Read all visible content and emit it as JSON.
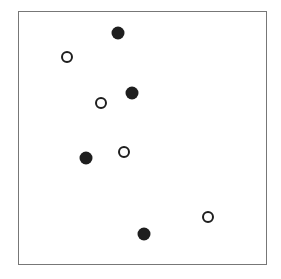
{
  "diagram": {
    "frame": {
      "left": 18,
      "top": 11,
      "right": 267,
      "bottom": 265,
      "border_color": "#777777"
    },
    "marker_color": "#1e1e1e",
    "points": [
      {
        "type": "filled",
        "x": 118,
        "y": 33
      },
      {
        "type": "open",
        "x": 67,
        "y": 57
      },
      {
        "type": "filled",
        "x": 132,
        "y": 93
      },
      {
        "type": "open",
        "x": 101,
        "y": 103
      },
      {
        "type": "filled",
        "x": 86,
        "y": 158
      },
      {
        "type": "open",
        "x": 124,
        "y": 152
      },
      {
        "type": "open",
        "x": 208,
        "y": 217
      },
      {
        "type": "filled",
        "x": 144,
        "y": 234
      }
    ]
  }
}
